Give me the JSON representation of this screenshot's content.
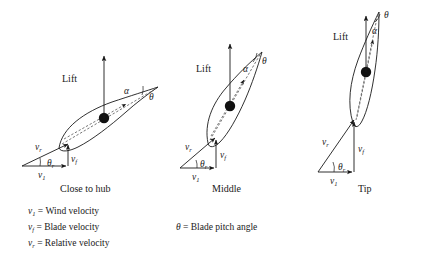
{
  "figure": {
    "background": "#ffffff",
    "ink_color": "#1a1a1a",
    "dashed_color": "#555555"
  },
  "panels": [
    {
      "id": "close-to-hub",
      "caption": "Close to hub",
      "lift_label": "Lift",
      "pitch_symbol": "θ",
      "alpha_symbol": "α",
      "chord_angle_deg": 28,
      "triangle": {
        "relative_symbol": "v",
        "relative_sub": "r",
        "blade_symbol": "v",
        "blade_sub": "f",
        "wind_symbol": "v",
        "wind_sub": "1",
        "angle_symbol": "θ",
        "angle_sub": "r",
        "relative_angle_deg": 28
      }
    },
    {
      "id": "middle",
      "caption": "Middle",
      "lift_label": "Lift",
      "pitch_symbol": "θ",
      "alpha_symbol": "α",
      "chord_angle_deg": 55,
      "triangle": {
        "relative_symbol": "v",
        "relative_sub": "r",
        "blade_symbol": "v",
        "blade_sub": "f",
        "wind_symbol": "v",
        "wind_sub": "1",
        "angle_symbol": "θ",
        "angle_sub": "r",
        "relative_angle_deg": 48
      }
    },
    {
      "id": "tip",
      "caption": "Tip",
      "lift_label": "Lift",
      "pitch_symbol": "θ",
      "alpha_symbol": "α",
      "chord_angle_deg": 72,
      "triangle": {
        "relative_symbol": "v",
        "relative_sub": "r",
        "blade_symbol": "v",
        "blade_sub": "f",
        "wind_symbol": "v",
        "wind_sub": "1",
        "angle_symbol": "θ",
        "angle_sub": "r",
        "relative_angle_deg": 64
      }
    }
  ],
  "legend": {
    "left_column": [
      {
        "symbol": "v",
        "sub": "1",
        "equals": "=",
        "definition": "Wind velocity"
      },
      {
        "symbol": "v",
        "sub": "f",
        "equals": "=",
        "definition": "Blade velocity"
      },
      {
        "symbol": "v",
        "sub": "r",
        "equals": "=",
        "definition": "Relative velocity"
      }
    ],
    "right_column": [
      {
        "symbol": "θ",
        "sub": "",
        "equals": "=",
        "definition": "Blade pitch angle"
      }
    ]
  }
}
